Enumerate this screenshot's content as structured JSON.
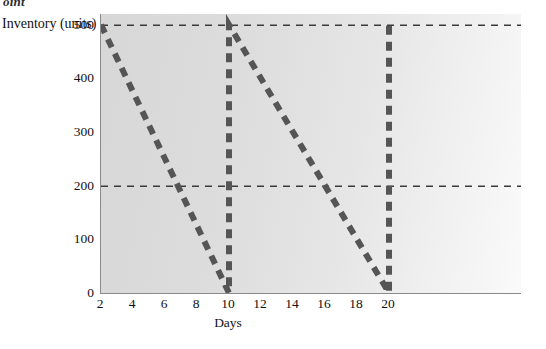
{
  "figure": {
    "top_caption": "oint",
    "y_axis_title": "Inventory (units)",
    "x_axis_title": "Days"
  },
  "chart_data": {
    "type": "line",
    "title": "",
    "subtitle": "",
    "xlabel": "Days",
    "ylabel": "Inventory (units)",
    "xlim": [
      2,
      22
    ],
    "ylim": [
      0,
      520
    ],
    "grid": false,
    "legend_position": "none",
    "xticks": [
      2,
      4,
      6,
      8,
      10,
      12,
      14,
      16,
      18,
      20
    ],
    "yticks": [
      0,
      100,
      200,
      300,
      400,
      500
    ],
    "series": [
      {
        "name": "Inventory level",
        "style": "dashed",
        "color": "#555555",
        "linewidth": 6,
        "x": [
          2,
          10,
          10,
          20,
          20
        ],
        "y": [
          500,
          0,
          500,
          0,
          500
        ]
      }
    ],
    "reference_lines": [
      {
        "name": "maximum-inventory-line",
        "axis": "y",
        "value": 500,
        "style": "dashed",
        "color": "#3a3a3a"
      },
      {
        "name": "reorder-point-line",
        "axis": "y",
        "value": 200,
        "style": "dashed",
        "color": "#3a3a3a"
      }
    ],
    "annotations": []
  }
}
